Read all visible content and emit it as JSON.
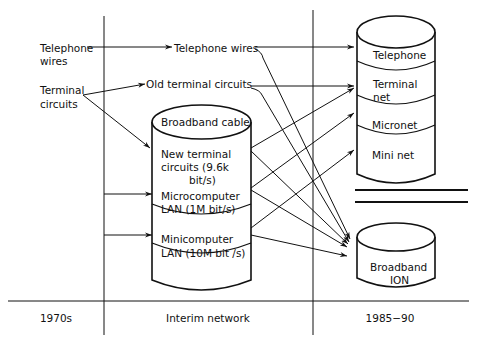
{
  "diagram": {
    "type": "network-evolution",
    "periods": {
      "left": "1970s",
      "middle": "Interim network",
      "right": "1985−90"
    },
    "sources_1970s": {
      "telephone_wires_line1": "Telephone",
      "telephone_wires_line2": "wires",
      "terminal_circuits_line1": "Terminal",
      "terminal_circuits_line2": "circuits"
    },
    "interim": {
      "telephone_wires": "Telephone wires",
      "old_terminal_circuits": "Old terminal circuits",
      "broadband_cable": {
        "title": "Broadband cable",
        "segments": [
          {
            "line1": "New terminal",
            "line2": "circuits (9.6k",
            "line3": "bit/s)"
          },
          {
            "line1": "Microcomputer",
            "line2": "LAN (1M bit/s)"
          },
          {
            "line1": "Minicomputer",
            "line2": "LAN (10M bit /s)"
          }
        ]
      }
    },
    "target_1985_90": {
      "stack": [
        {
          "line1": "Telephone"
        },
        {
          "line1": "Terminal",
          "line2": "net"
        },
        {
          "line1": "Micronet"
        },
        {
          "line1": "Mini net"
        }
      ],
      "separator": "equals",
      "broadband_ion": {
        "line1": "Broadband",
        "line2": "ION"
      }
    },
    "edges": [
      {
        "from": "Telephone wires (1970s)",
        "to": "Telephone wires (interim)"
      },
      {
        "from": "Terminal circuits (1970s)",
        "to": "Old terminal circuits"
      },
      {
        "from": "Terminal circuits (1970s)",
        "to": "New terminal circuits"
      },
      {
        "from": "1970s timeline",
        "to": "Microcomputer LAN"
      },
      {
        "from": "1970s timeline",
        "to": "Minicomputer LAN"
      },
      {
        "from": "Telephone wires (interim)",
        "to": "Telephone"
      },
      {
        "from": "Old terminal circuits",
        "to": "Terminal net"
      },
      {
        "from": "New terminal circuits",
        "to": "Terminal net"
      },
      {
        "from": "Microcomputer LAN",
        "to": "Micronet"
      },
      {
        "from": "Minicomputer LAN",
        "to": "Mini net"
      },
      {
        "from": "Telephone wires (interim)",
        "to": "Broadband ION"
      },
      {
        "from": "Old terminal circuits",
        "to": "Broadband ION"
      },
      {
        "from": "New terminal circuits",
        "to": "Broadband ION"
      },
      {
        "from": "Microcomputer LAN",
        "to": "Broadband ION"
      },
      {
        "from": "Minicomputer LAN",
        "to": "Broadband ION"
      }
    ]
  }
}
